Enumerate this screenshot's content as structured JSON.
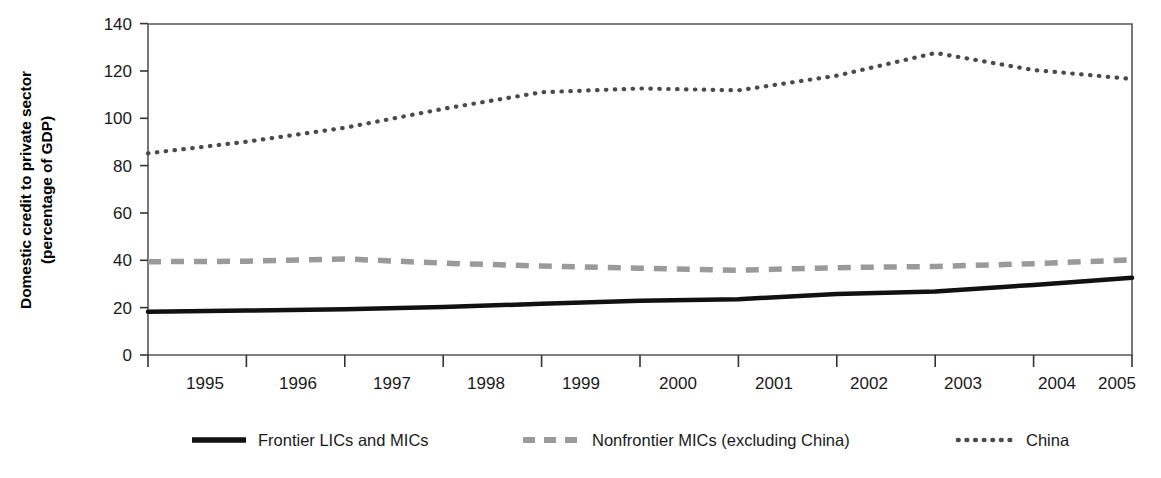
{
  "chart_data": {
    "type": "line",
    "title": "",
    "subtitle": "",
    "xlabel": "",
    "ylabel": "Domestic credit to private sector (percentage of GDP)",
    "ylabel_line1": "Domestic credit to private sector",
    "ylabel_line2": "(percentage of GDP)",
    "x": [
      1995,
      1996,
      1997,
      1998,
      1999,
      2000,
      2001,
      2002,
      2003,
      2004,
      2005
    ],
    "categories": [
      "1995",
      "1996",
      "1997",
      "1998",
      "1999",
      "2000",
      "2001",
      "2002",
      "2003",
      "2004",
      "2005"
    ],
    "xlim": [
      1995,
      2005
    ],
    "ylim": [
      0,
      140
    ],
    "yticks": [
      0,
      20,
      40,
      60,
      80,
      100,
      120,
      140
    ],
    "ytick_labels": [
      "0",
      "20",
      "40",
      "60",
      "80",
      "100",
      "120",
      "140"
    ],
    "grid": false,
    "legend_position": "bottom",
    "series": [
      {
        "name": "Frontier LICs and MICs",
        "style": "solid",
        "color": "#111111",
        "width": 4.5,
        "values": [
          18.3,
          18.8,
          19.3,
          20.3,
          21.6,
          22.9,
          23.6,
          25.8,
          26.8,
          29.6,
          32.6
        ]
      },
      {
        "name": "Nonfrontier MICs (excluding China)",
        "style": "dashed",
        "color": "#9a9a9a",
        "width": 5.5,
        "values": [
          39.4,
          39.6,
          40.6,
          38.8,
          37.6,
          36.7,
          35.8,
          36.9,
          37.4,
          38.6,
          40.2
        ]
      },
      {
        "name": "China",
        "style": "dotted",
        "color": "#4a4a4a",
        "width": 4.2,
        "values": [
          85.2,
          90.1,
          96.0,
          104.0,
          111.0,
          112.6,
          111.8,
          118.0,
          127.6,
          120.4,
          116.6
        ]
      }
    ]
  },
  "axes": {
    "y_tick_color": "#333333",
    "x_tick_color": "#333333",
    "border_color": "#555555"
  },
  "legend": {
    "items": [
      {
        "label": "Frontier LICs and MICs",
        "swatch": "solid-line-swatch",
        "color": "#111111"
      },
      {
        "label": "Nonfrontier MICs (excluding China)",
        "swatch": "dashed-line-swatch",
        "color": "#9a9a9a"
      },
      {
        "label": "China",
        "swatch": "dotted-line-swatch",
        "color": "#4a4a4a"
      }
    ]
  }
}
